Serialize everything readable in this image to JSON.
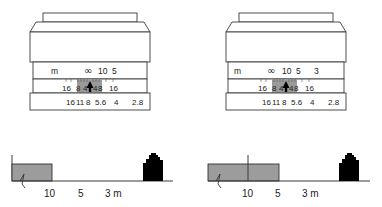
{
  "diagram": {
    "panels": [
      {
        "id": "left",
        "lens": {
          "distance_scale": {
            "unit_label": "m",
            "values": [
              "∞",
              "10",
              "5"
            ]
          },
          "dof_scale": {
            "values": [
              "16",
              "8",
              "4",
              "4",
              "8",
              "16"
            ]
          },
          "aperture_scale": {
            "values": [
              "16",
              "11",
              "8",
              "5.6",
              "4",
              "2.8"
            ]
          },
          "index_mark": "arrow-up",
          "focus_setting": "∞"
        },
        "distance_line": {
          "labels": [
            "10",
            "5",
            "3 m"
          ],
          "sharp_zone": "infinity to 10 m",
          "subject": "house-silhouette"
        }
      },
      {
        "id": "right",
        "lens": {
          "distance_scale": {
            "unit_label": "m",
            "values": [
              "∞",
              "10",
              "5",
              "3"
            ]
          },
          "dof_scale": {
            "values": [
              "16",
              "8",
              "4",
              "4",
              "8",
              "16"
            ]
          },
          "aperture_scale": {
            "values": [
              "16",
              "11",
              "8",
              "5.6",
              "4",
              "2.8"
            ]
          },
          "index_mark": "arrow-up",
          "focus_setting": "10"
        },
        "distance_line": {
          "labels": [
            "10",
            "5",
            "3 m"
          ],
          "sharp_zone": "infinity to 5 m",
          "focus_marker": "10",
          "subject": "house-silhouette"
        }
      }
    ],
    "colors": {
      "outline": "#3a3a3a",
      "dof_highlight": "#9a9a9a",
      "sharp_zone": "#9c9c9c",
      "subject": "#000000"
    }
  }
}
